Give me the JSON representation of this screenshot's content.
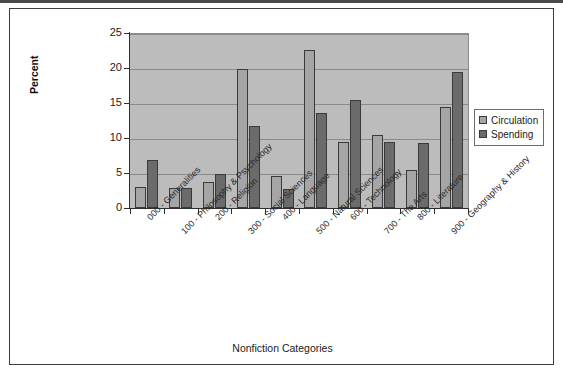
{
  "chart_data": {
    "type": "bar",
    "title": "",
    "xlabel": "Nonfiction Categories",
    "ylabel": "Percent",
    "ylim": [
      0,
      25
    ],
    "yticks": [
      0,
      5,
      10,
      15,
      20,
      25
    ],
    "grid": true,
    "legend_position": "right",
    "categories": [
      "000 - Generalities",
      "100 - Philosophy & Psychology",
      "200 - Religion",
      "300 - Social Sciences",
      "400 - Language",
      "500 - Natural Sciences",
      "600 - Technology",
      "700 - The Arts",
      "800 - Literature",
      "900 - Geography & History"
    ],
    "series": [
      {
        "name": "Circulation",
        "color": "#a5a5a5",
        "values": [
          3.0,
          2.9,
          3.7,
          19.8,
          4.6,
          22.6,
          9.5,
          10.4,
          5.4,
          14.4
        ]
      },
      {
        "name": "Spending",
        "color": "#6b6b6b",
        "values": [
          6.9,
          2.9,
          4.8,
          11.7,
          2.7,
          13.6,
          15.4,
          9.4,
          9.3,
          19.4
        ]
      }
    ]
  },
  "legend": {
    "items": [
      {
        "label": "Circulation",
        "swatch": "circ"
      },
      {
        "label": "Spending",
        "swatch": "spend"
      }
    ]
  },
  "axes": {
    "y_title": "Percent",
    "x_title": "Nonfiction Categories",
    "y_tick_labels": [
      "0",
      "5",
      "10",
      "15",
      "20",
      "25"
    ]
  }
}
